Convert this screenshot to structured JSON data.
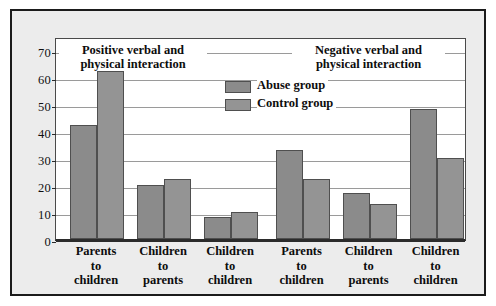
{
  "chart_data": {
    "type": "bar",
    "title": "",
    "panels": [
      {
        "title_line1": "Positive verbal and",
        "title_line2": "physical interaction",
        "categories": [
          {
            "line1": "Parents",
            "line2": "to",
            "line3": "children"
          },
          {
            "line1": "Children",
            "line2": "to",
            "line3": "parents"
          },
          {
            "line1": "Children",
            "line2": "to",
            "line3": "children"
          }
        ],
        "series": [
          {
            "name": "Abuse group",
            "values": [
              42,
              20,
              8
            ]
          },
          {
            "name": "Control group",
            "values": [
              62,
              22,
              10
            ]
          }
        ]
      },
      {
        "title_line1": "Negative verbal and",
        "title_line2": "physical interaction",
        "categories": [
          {
            "line1": "Parents",
            "line2": "to",
            "line3": "children"
          },
          {
            "line1": "Children",
            "line2": "to",
            "line3": "parents"
          },
          {
            "line1": "Children",
            "line2": "to",
            "line3": "children"
          }
        ],
        "series": [
          {
            "name": "Abuse group",
            "values": [
              33,
              17,
              48
            ]
          },
          {
            "name": "Control group",
            "values": [
              22,
              13,
              30
            ]
          }
        ]
      }
    ],
    "xlabel": "",
    "ylabel": "",
    "ylim": [
      0,
      75
    ],
    "yticks": [
      0,
      10,
      20,
      30,
      40,
      50,
      60,
      70
    ],
    "grid": true,
    "legend_position": "center-top",
    "colors": {
      "abuse": "#8b8b8b",
      "control": "#949494",
      "bar_border": "#4f4f4f",
      "gridline": "#9a9a9a",
      "axis": "#2b2b2b",
      "panel_background": "#ececec",
      "plot_background": "#ffffff",
      "frame_border": "#1b1b1b",
      "text": "#0d0d0d"
    }
  },
  "legend": {
    "items": [
      {
        "label_line1": "Abuse",
        "label_line2": "group",
        "key": "abuse"
      },
      {
        "label_line1": "Control",
        "label_line2": "group",
        "key": "control"
      }
    ]
  },
  "yticks": {
    "t0": "0",
    "t1": "10",
    "t2": "20",
    "t3": "30",
    "t4": "40",
    "t5": "50",
    "t6": "60",
    "t7": "70"
  }
}
